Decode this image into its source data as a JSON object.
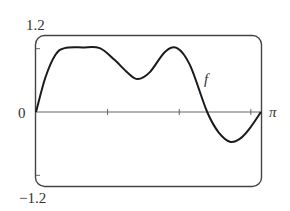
{
  "chart_data": {
    "type": "line",
    "title": "",
    "xlabel": "",
    "ylabel": "",
    "xlim": [
      0,
      3.14159
    ],
    "ylim": [
      -1.2,
      1.2
    ],
    "x_tick_positions": [
      1,
      2,
      3
    ],
    "y_tick_positions": [
      -1,
      1
    ],
    "y_tick_labels": [
      "1.2",
      "0",
      "−1.2"
    ],
    "x_end_label": "π",
    "grid": false,
    "legend": null,
    "series": [
      {
        "name": "f",
        "x": [
          0,
          0.13,
          0.27,
          0.4,
          0.65,
          0.89,
          1.1,
          1.28,
          1.42,
          1.59,
          1.8,
          1.97,
          2.15,
          2.39,
          2.55,
          2.71,
          2.85,
          2.99,
          3.14
        ],
        "values": [
          0,
          0.54,
          0.9,
          1.01,
          1.02,
          1.01,
          0.82,
          0.62,
          0.52,
          0.63,
          0.95,
          1.01,
          0.74,
          0,
          -0.32,
          -0.47,
          -0.42,
          -0.25,
          0
        ]
      }
    ],
    "annotations": [
      {
        "text": "f",
        "x": 2.42,
        "y": 0.55
      }
    ]
  },
  "labels": {
    "y_top": "1.2",
    "y_zero": "0",
    "y_bottom": "−1.2",
    "x_end": "π",
    "curve": "f"
  },
  "colors": {
    "curve": "#1a1a1a",
    "frame": "#444444",
    "axis": "#555555",
    "text": "#333333"
  }
}
